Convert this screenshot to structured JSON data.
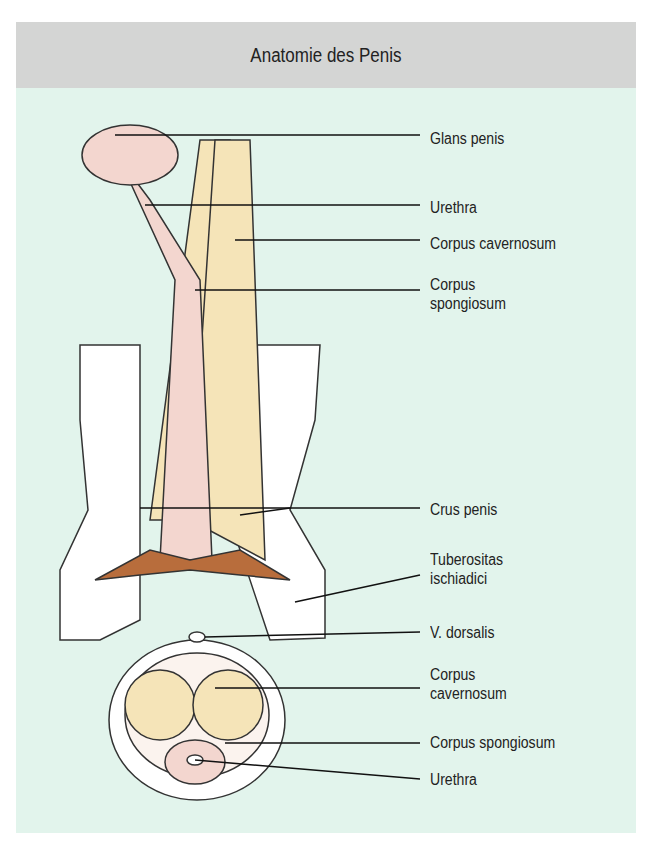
{
  "title": "Anatomie des Penis",
  "labels": {
    "glans": "Glans penis",
    "urethra_top": "Urethra",
    "cav_top": "Corpus cavernosum",
    "spong_top_1": "Corpus",
    "spong_top_2": "spongiosum",
    "crus": "Crus penis",
    "tub_1": "Tuberositas",
    "tub_2": "ischiadici",
    "vdors": "V. dorsalis",
    "cav_bot_1": "Corpus",
    "cav_bot_2": "cavernosum",
    "spong_bot": "Corpus spongiosum",
    "urethra_bot": "Urethra"
  }
}
